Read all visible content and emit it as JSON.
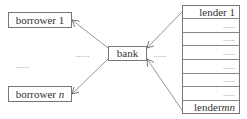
{
  "diagram": {
    "borrowers": {
      "first": "borrower 1",
      "last_prefix": "borrower ",
      "last_var": "n",
      "ellipsis": "......"
    },
    "bank": {
      "label": "bank",
      "left_ellipsis": "......",
      "right_ellipsis": "......"
    },
    "lenders": {
      "rows": [
        {
          "label": "lender 1",
          "type": "label"
        },
        {
          "label": "......",
          "type": "dots"
        },
        {
          "label": "......",
          "type": "dots"
        },
        {
          "label": "......",
          "type": "dots"
        },
        {
          "label": "......",
          "type": "dots"
        },
        {
          "label": "......",
          "type": "dots"
        },
        {
          "label": "......",
          "type": "dots"
        },
        {
          "label_prefix": "lender ",
          "label_var": "mn",
          "type": "label"
        }
      ]
    },
    "edges": [
      {
        "from": "lender 1",
        "to": "bank"
      },
      {
        "from": "lender mn",
        "to": "bank"
      },
      {
        "from": "bank",
        "to": "borrower 1"
      },
      {
        "from": "bank",
        "to": "borrower n"
      }
    ]
  }
}
